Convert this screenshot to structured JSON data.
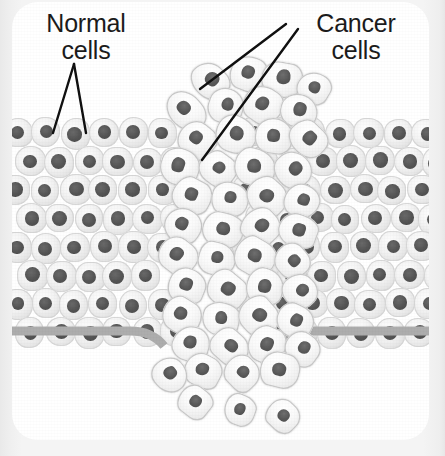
{
  "figure": {
    "card": {
      "x": 12,
      "y": 2,
      "width": 417,
      "height": 438,
      "corner_radius": 26,
      "background": "#ffffff"
    },
    "page_background": "#f2f2f2"
  },
  "labels": [
    {
      "id": "normal-cells",
      "text": "Normal\ncells",
      "x": 8,
      "y": 8,
      "width": 132,
      "color": "#1c1c1c",
      "font_size": 25
    },
    {
      "id": "cancer-cells",
      "text": "Cancer\ncells",
      "x": 278,
      "y": 8,
      "width": 132,
      "color": "#1c1c1c",
      "font_size": 25
    }
  ],
  "leader_lines": {
    "color": "#111111",
    "width": 2.4,
    "lines": [
      {
        "name": "normal-leader-left",
        "x1": 62,
        "y1": 62,
        "x2": 41,
        "y2": 131
      },
      {
        "name": "normal-leader-right",
        "x1": 62,
        "y1": 62,
        "x2": 74,
        "y2": 131
      },
      {
        "name": "cancer-leader-upper",
        "x1": 274,
        "y1": 22,
        "x2": 188,
        "y2": 87
      },
      {
        "name": "cancer-leader-lower",
        "x1": 286,
        "y1": 27,
        "x2": 190,
        "y2": 158
      }
    ]
  },
  "epithelium": {
    "name": "normal-epithelial-tissue",
    "cell_fill": "#f1f1f1",
    "cell_outline": "#d7d7d7",
    "nucleus_color": "#555555",
    "cell_width": 30,
    "cell_height": 30,
    "nucleus_diameter": 14,
    "row_spacing": 28.5,
    "col_spacing": 29,
    "top_y": 116,
    "rows": 8,
    "left_block": {
      "x_start": -10,
      "x_end": 172
    },
    "right_block": {
      "x_start": 248,
      "x_end": 432
    },
    "row_offsets": [
      0,
      14,
      0,
      14,
      0,
      14,
      0,
      14
    ],
    "row_left_limits": [
      160,
      155,
      150,
      150,
      148,
      146,
      150,
      160
    ],
    "row_right_limits": [
      255,
      252,
      250,
      248,
      250,
      252,
      256,
      262
    ]
  },
  "basement_membrane": {
    "name": "basement-membrane",
    "color": "#adadad",
    "thickness": 9,
    "base_y": 329,
    "dip_y": 344,
    "left_span": [
      0,
      150
    ],
    "right_span": [
      262,
      417
    ],
    "description": "grey band beneath the epithelium, dipping and interrupted where tumour cells break through"
  },
  "tumor": {
    "name": "cancer-cell-mass",
    "cell_fill": "#f7f7f7",
    "cell_outline": "#c9c9c9",
    "nucleus_color": "#5a5a5a",
    "cells": [
      {
        "x": 178,
        "y": 62,
        "w": 40,
        "h": 34,
        "r": 46,
        "nx": 0.5,
        "ny": 0.42,
        "nw": 0.36,
        "nh": 0.4
      },
      {
        "x": 218,
        "y": 54,
        "w": 38,
        "h": 36,
        "r": 22,
        "nx": 0.46,
        "ny": 0.46,
        "nw": 0.34,
        "nh": 0.36
      },
      {
        "x": 249,
        "y": 60,
        "w": 42,
        "h": 36,
        "r": 10,
        "nx": 0.52,
        "ny": 0.4,
        "nw": 0.34,
        "nh": 0.4
      },
      {
        "x": 285,
        "y": 70,
        "w": 34,
        "h": 32,
        "r": 30,
        "nx": 0.5,
        "ny": 0.46,
        "nw": 0.34,
        "nh": 0.38
      },
      {
        "x": 152,
        "y": 92,
        "w": 44,
        "h": 34,
        "r": 50,
        "nx": 0.4,
        "ny": 0.48,
        "nw": 0.32,
        "nh": 0.4
      },
      {
        "x": 196,
        "y": 86,
        "w": 36,
        "h": 36,
        "r": 18,
        "nx": 0.52,
        "ny": 0.44,
        "nw": 0.34,
        "nh": 0.36
      },
      {
        "x": 231,
        "y": 84,
        "w": 40,
        "h": 38,
        "r": 35,
        "nx": 0.46,
        "ny": 0.48,
        "nw": 0.34,
        "nh": 0.36
      },
      {
        "x": 268,
        "y": 92,
        "w": 38,
        "h": 34,
        "r": 14,
        "nx": 0.52,
        "ny": 0.44,
        "nw": 0.34,
        "nh": 0.4
      },
      {
        "x": 166,
        "y": 120,
        "w": 38,
        "h": 36,
        "r": 40,
        "nx": 0.44,
        "ny": 0.46,
        "nw": 0.34,
        "nh": 0.36
      },
      {
        "x": 203,
        "y": 114,
        "w": 42,
        "h": 38,
        "r": 26,
        "nx": 0.5,
        "ny": 0.44,
        "nw": 0.34,
        "nh": 0.38
      },
      {
        "x": 243,
        "y": 116,
        "w": 38,
        "h": 36,
        "r": 8,
        "nx": 0.48,
        "ny": 0.48,
        "nw": 0.34,
        "nh": 0.36
      },
      {
        "x": 276,
        "y": 120,
        "w": 40,
        "h": 34,
        "r": 44,
        "nx": 0.52,
        "ny": 0.44,
        "nw": 0.32,
        "nh": 0.4
      },
      {
        "x": 148,
        "y": 146,
        "w": 40,
        "h": 38,
        "r": 20,
        "nx": 0.44,
        "ny": 0.46,
        "nw": 0.34,
        "nh": 0.38
      },
      {
        "x": 187,
        "y": 150,
        "w": 38,
        "h": 34,
        "r": 36,
        "nx": 0.5,
        "ny": 0.44,
        "nw": 0.34,
        "nh": 0.38
      },
      {
        "x": 222,
        "y": 146,
        "w": 42,
        "h": 38,
        "r": 12,
        "nx": 0.48,
        "ny": 0.48,
        "nw": 0.34,
        "nh": 0.36
      },
      {
        "x": 262,
        "y": 150,
        "w": 38,
        "h": 36,
        "r": 48,
        "nx": 0.52,
        "ny": 0.42,
        "nw": 0.34,
        "nh": 0.38
      },
      {
        "x": 160,
        "y": 176,
        "w": 40,
        "h": 36,
        "r": 28,
        "nx": 0.46,
        "ny": 0.46,
        "nw": 0.34,
        "nh": 0.38
      },
      {
        "x": 199,
        "y": 180,
        "w": 38,
        "h": 34,
        "r": 16,
        "nx": 0.5,
        "ny": 0.44,
        "nw": 0.34,
        "nh": 0.38
      },
      {
        "x": 234,
        "y": 176,
        "w": 42,
        "h": 38,
        "r": 42,
        "nx": 0.48,
        "ny": 0.48,
        "nw": 0.34,
        "nh": 0.36
      },
      {
        "x": 272,
        "y": 182,
        "w": 36,
        "h": 34,
        "r": 24,
        "nx": 0.52,
        "ny": 0.44,
        "nw": 0.34,
        "nh": 0.38
      },
      {
        "x": 152,
        "y": 206,
        "w": 38,
        "h": 36,
        "r": 34,
        "nx": 0.44,
        "ny": 0.46,
        "nw": 0.34,
        "nh": 0.38
      },
      {
        "x": 190,
        "y": 210,
        "w": 42,
        "h": 36,
        "r": 10,
        "nx": 0.5,
        "ny": 0.46,
        "nw": 0.34,
        "nh": 0.38
      },
      {
        "x": 230,
        "y": 206,
        "w": 38,
        "h": 38,
        "r": 46,
        "nx": 0.48,
        "ny": 0.44,
        "nw": 0.34,
        "nh": 0.36
      },
      {
        "x": 266,
        "y": 212,
        "w": 40,
        "h": 34,
        "r": 20,
        "nx": 0.52,
        "ny": 0.46,
        "nw": 0.32,
        "nh": 0.4
      },
      {
        "x": 146,
        "y": 236,
        "w": 40,
        "h": 36,
        "r": 38,
        "nx": 0.44,
        "ny": 0.48,
        "nw": 0.34,
        "nh": 0.38
      },
      {
        "x": 186,
        "y": 240,
        "w": 38,
        "h": 34,
        "r": 14,
        "nx": 0.5,
        "ny": 0.44,
        "nw": 0.34,
        "nh": 0.38
      },
      {
        "x": 222,
        "y": 236,
        "w": 42,
        "h": 38,
        "r": 30,
        "nx": 0.48,
        "ny": 0.46,
        "nw": 0.34,
        "nh": 0.36
      },
      {
        "x": 262,
        "y": 242,
        "w": 36,
        "h": 34,
        "r": 50,
        "nx": 0.52,
        "ny": 0.44,
        "nw": 0.34,
        "nh": 0.38
      },
      {
        "x": 156,
        "y": 266,
        "w": 38,
        "h": 36,
        "r": 22,
        "nx": 0.46,
        "ny": 0.46,
        "nw": 0.34,
        "nh": 0.38
      },
      {
        "x": 194,
        "y": 270,
        "w": 42,
        "h": 36,
        "r": 40,
        "nx": 0.5,
        "ny": 0.44,
        "nw": 0.34,
        "nh": 0.38
      },
      {
        "x": 234,
        "y": 266,
        "w": 38,
        "h": 38,
        "r": 16,
        "nx": 0.48,
        "ny": 0.48,
        "nw": 0.34,
        "nh": 0.36
      },
      {
        "x": 270,
        "y": 272,
        "w": 36,
        "h": 34,
        "r": 44,
        "nx": 0.52,
        "ny": 0.42,
        "nw": 0.34,
        "nh": 0.38
      },
      {
        "x": 150,
        "y": 296,
        "w": 40,
        "h": 36,
        "r": 32,
        "nx": 0.44,
        "ny": 0.46,
        "nw": 0.34,
        "nh": 0.38
      },
      {
        "x": 190,
        "y": 300,
        "w": 38,
        "h": 34,
        "r": 12,
        "nx": 0.5,
        "ny": 0.46,
        "nw": 0.34,
        "nh": 0.38
      },
      {
        "x": 226,
        "y": 296,
        "w": 42,
        "h": 38,
        "r": 48,
        "nx": 0.48,
        "ny": 0.44,
        "nw": 0.34,
        "nh": 0.36
      },
      {
        "x": 264,
        "y": 302,
        "w": 38,
        "h": 34,
        "r": 26,
        "nx": 0.52,
        "ny": 0.46,
        "nw": 0.32,
        "nh": 0.4
      },
      {
        "x": 160,
        "y": 324,
        "w": 38,
        "h": 36,
        "r": 18,
        "nx": 0.46,
        "ny": 0.46,
        "nw": 0.34,
        "nh": 0.38
      },
      {
        "x": 198,
        "y": 328,
        "w": 40,
        "h": 34,
        "r": 42,
        "nx": 0.5,
        "ny": 0.44,
        "nw": 0.34,
        "nh": 0.38
      },
      {
        "x": 236,
        "y": 324,
        "w": 38,
        "h": 38,
        "r": 24,
        "nx": 0.48,
        "ny": 0.48,
        "nw": 0.34,
        "nh": 0.36
      },
      {
        "x": 272,
        "y": 330,
        "w": 36,
        "h": 34,
        "r": 36,
        "nx": 0.52,
        "ny": 0.42,
        "nw": 0.34,
        "nh": 0.38
      },
      {
        "x": 172,
        "y": 352,
        "w": 38,
        "h": 34,
        "r": 28,
        "nx": 0.46,
        "ny": 0.46,
        "nw": 0.34,
        "nh": 0.38
      },
      {
        "x": 212,
        "y": 354,
        "w": 36,
        "h": 34,
        "r": 46,
        "nx": 0.5,
        "ny": 0.44,
        "nw": 0.34,
        "nh": 0.38
      },
      {
        "x": 248,
        "y": 350,
        "w": 40,
        "h": 36,
        "r": 14,
        "nx": 0.48,
        "ny": 0.48,
        "nw": 0.34,
        "nh": 0.36
      },
      {
        "x": 140,
        "y": 356,
        "w": 36,
        "h": 34,
        "r": 50,
        "nx": 0.46,
        "ny": 0.46,
        "nw": 0.34,
        "nh": 0.38
      },
      {
        "x": 166,
        "y": 384,
        "w": 34,
        "h": 32,
        "r": 38,
        "nx": 0.5,
        "ny": 0.46,
        "nw": 0.34,
        "nh": 0.38
      },
      {
        "x": 212,
        "y": 392,
        "w": 32,
        "h": 32,
        "r": 20,
        "nx": 0.48,
        "ny": 0.46,
        "nw": 0.34,
        "nh": 0.38
      },
      {
        "x": 254,
        "y": 398,
        "w": 34,
        "h": 32,
        "r": 44,
        "nx": 0.5,
        "ny": 0.46,
        "nw": 0.34,
        "nh": 0.38
      }
    ]
  }
}
